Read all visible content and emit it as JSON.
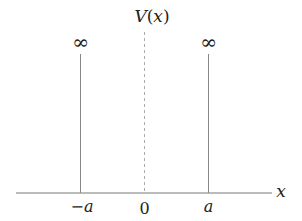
{
  "diagram": {
    "y_label": "V(x)",
    "x_label": "x",
    "walls": [
      {
        "position_label": "−a",
        "height_label": "∞"
      },
      {
        "position_label": "a",
        "height_label": "∞"
      }
    ],
    "origin_label": "0",
    "colors": {
      "axis": "#777777",
      "wall": "#888888",
      "dashed_center": "#aaaaaa",
      "text": "#222222"
    }
  }
}
